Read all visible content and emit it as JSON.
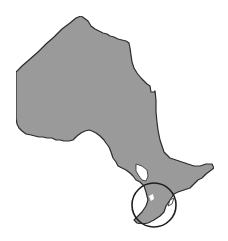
{
  "map": {
    "subject": "Ontario province outline",
    "highlight": "Southern Ontario circled",
    "colors": {
      "land_fill": "#9c9c9c",
      "outline": "#2a2a2a",
      "circle_stroke": "#1e1e1e",
      "background": "#ffffff",
      "lake_gap": "#ffffff"
    },
    "highlight_circle": {
      "cx": 154,
      "cy": 205,
      "r": 22
    }
  }
}
